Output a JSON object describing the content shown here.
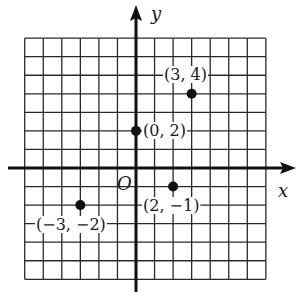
{
  "chart_data": {
    "type": "scatter",
    "title": "",
    "xlabel": "x",
    "ylabel": "y",
    "origin_label": "O",
    "xlim": [
      -6,
      7
    ],
    "ylim": [
      -6,
      7
    ],
    "grid": true,
    "grid_step": 1,
    "points": [
      {
        "x": 3,
        "y": 4,
        "label": "(3, 4)"
      },
      {
        "x": 0,
        "y": 2,
        "label": "(0, 2)"
      },
      {
        "x": 2,
        "y": -1,
        "label": "(2, −1)"
      },
      {
        "x": -3,
        "y": -2,
        "label": "(−3, −2)"
      }
    ]
  },
  "colors": {
    "grid": "#2a2a2a",
    "axis": "#111111",
    "point": "#111111",
    "background": "#ffffff"
  }
}
